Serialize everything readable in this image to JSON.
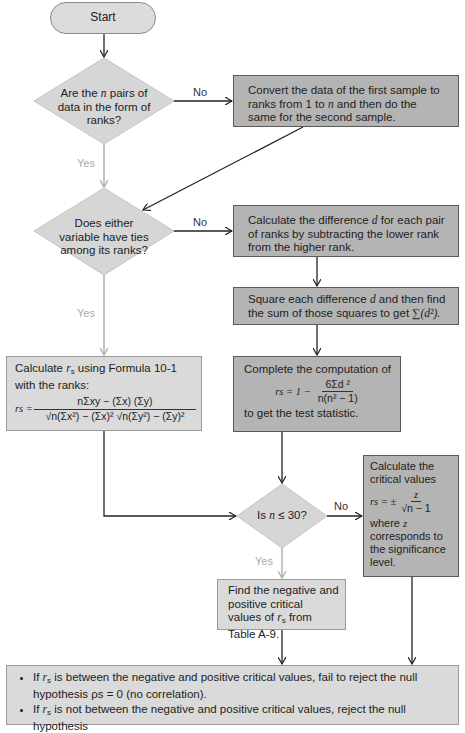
{
  "flowchart": {
    "start": {
      "label": "Start"
    },
    "decision_ranks": {
      "text_pre": "Are the ",
      "var": "n",
      "text_post": " pairs of data in the form of ranks?",
      "no_label": "No",
      "yes_label": "Yes"
    },
    "convert_box": {
      "text_pre": "Convert the data of the first sample to ranks from 1 to ",
      "var": "n",
      "text_post": " and then do the same for the second sample."
    },
    "decision_ties": {
      "text": "Does either variable have ties among its ranks?",
      "no_label": "No",
      "yes_label": "Yes"
    },
    "difference_box": {
      "text_pre": "Calculate the difference ",
      "var": "d",
      "text_post": " for each pair of ranks by subtracting the lower rank from the higher rank."
    },
    "square_box": {
      "text_pre": "Square each difference ",
      "var": "d",
      "text_mid": " and then find the sum of those squares to get ",
      "formula": "∑(d²)."
    },
    "formula_box": {
      "text_pre": "Calculate ",
      "var": "r",
      "sub": "s",
      "text_post": " using  Formula 10-1 with the ranks:",
      "lhs": "rs =",
      "numerator": "nΣxy − (Σx) (Σy)",
      "denominator": "√n(Σx²) − (Σx)² √n(Σy²) − (Σy)²"
    },
    "compute_box": {
      "line1": "Complete the computation of",
      "lhs": "rs = 1 −",
      "numerator": "6Σd ²",
      "denominator": "n(n² − 1)",
      "line3": "to get the test statistic."
    },
    "decision_n": {
      "text_pre": "Is ",
      "var": "n",
      "text_post": " ≤ 30?",
      "no_label": "No",
      "yes_label": "Yes"
    },
    "critical_z_box": {
      "line1": "Calculate the critical values",
      "lhs": "rs = ±",
      "numerator": "z",
      "denominator": "√n − 1",
      "line3_pre": "where ",
      "line3_var": "z",
      "line3_post": " corresponds to the significance level."
    },
    "table_box": {
      "text_pre": "Find the negative and positive  critical values of ",
      "var": "r",
      "sub": "s",
      "text_post": " from  Table A-9."
    },
    "conclusion_box": {
      "bullets": [
        {
          "pre": "If ",
          "var": "r",
          "sub": "s",
          "post": " is between the negative and positive critical values, fail to reject the null hypothesis ρs = 0 (no correlation)."
        },
        {
          "pre": "If ",
          "var": "r",
          "sub": "s",
          "post": " is not between the negative and positive critical values, reject the null hypothesis"
        }
      ]
    }
  },
  "colors": {
    "dark_box": "#b4b4b4",
    "light_box": "#dadada",
    "diamond": "#d6d6d6",
    "yes_text": "#aaaaaa",
    "arrow_dark": "#222222",
    "arrow_light": "#a8a8a8"
  }
}
